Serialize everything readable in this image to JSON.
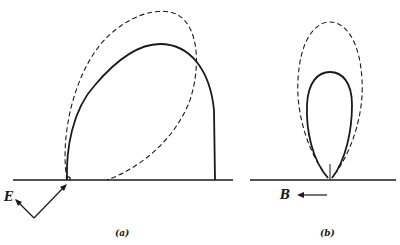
{
  "figure": {
    "panels": [
      {
        "id": "a",
        "caption": "(a)",
        "vector_label": "E",
        "curves": [
          "solid radiation pattern (tilted lobe)",
          "dashed radiation pattern (tilted ellipse)"
        ]
      },
      {
        "id": "b",
        "caption": "(b)",
        "vector_label": "B",
        "curves": [
          "solid radiation pattern (narrow lobe)",
          "dashed radiation pattern (tall ellipse)"
        ]
      }
    ],
    "colors": {
      "stroke": "#1a1a1a",
      "background": "#ffffff"
    }
  }
}
